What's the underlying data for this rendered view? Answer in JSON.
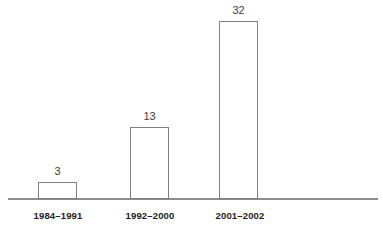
{
  "chart_data": {
    "type": "bar",
    "title": "",
    "subtitle": "",
    "xlabel": "",
    "ylabel": "",
    "categories": [
      "1984–1991",
      "1992–2000",
      "2001–2002"
    ],
    "values": [
      3,
      13,
      32
    ],
    "data_labels": [
      "3",
      "13",
      "32"
    ],
    "ylim": [
      0,
      35
    ],
    "grid": false,
    "legend": null,
    "legend_position": "none",
    "axis_visible": {
      "x": true,
      "y": false
    },
    "series": [
      {
        "name": "count",
        "values": [
          3,
          13,
          32
        ]
      }
    ],
    "annotations": [],
    "colors": {
      "bar_fill": "#ffffff",
      "bar_border": "#7f7f7f",
      "axis": "#8c8c8c",
      "value_label": "#3b3b3b",
      "category_label": "#1c1c1c",
      "background": "#ffffff"
    }
  }
}
